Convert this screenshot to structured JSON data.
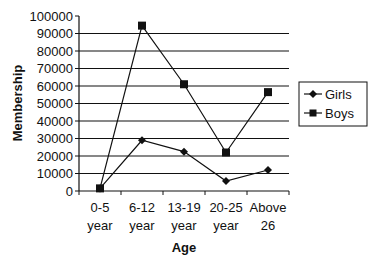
{
  "chart_data": {
    "type": "line",
    "title": "",
    "xlabel": "Age",
    "ylabel": "Membership",
    "categories": [
      "0-5 year",
      "6-12 year",
      "13-19 year",
      "20-25 year",
      "Above 26"
    ],
    "category_lines": [
      [
        "0-5",
        "year"
      ],
      [
        "6-12",
        "year"
      ],
      [
        "13-19",
        "year"
      ],
      [
        "20-25",
        "year"
      ],
      [
        "Above",
        "26"
      ]
    ],
    "series": [
      {
        "name": "Girls",
        "marker": "diamond",
        "values": [
          1500,
          29000,
          22500,
          5700,
          12000
        ]
      },
      {
        "name": "Boys",
        "marker": "square",
        "values": [
          1500,
          94500,
          61000,
          22000,
          56500
        ]
      }
    ],
    "ylim": [
      0,
      100000
    ],
    "yticks": [
      0,
      10000,
      20000,
      30000,
      40000,
      50000,
      60000,
      70000,
      80000,
      90000,
      100000
    ],
    "grid": true,
    "legend_position": "right"
  },
  "legend": {
    "items": [
      {
        "label": "Girls",
        "marker": "diamond-icon"
      },
      {
        "label": "Boys",
        "marker": "square-icon"
      }
    ]
  },
  "axes": {
    "x_title": "Age",
    "y_title": "Membership"
  },
  "colors": {
    "line": "#111111",
    "grid": "#111111",
    "background": "#ffffff"
  }
}
